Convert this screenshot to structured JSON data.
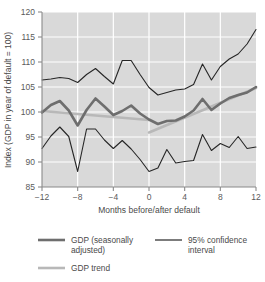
{
  "chart_data": {
    "type": "line",
    "title": "",
    "xlabel": "Months before/after default",
    "ylabel": "Index (GDP in year of default = 100)",
    "xlim": [
      -12,
      12
    ],
    "ylim": [
      85,
      120
    ],
    "xticks": [
      -12,
      -8,
      -4,
      0,
      4,
      8,
      12
    ],
    "yticks": [
      85,
      90,
      95,
      100,
      105,
      110,
      115,
      120
    ],
    "xtick_labels": [
      "−12",
      "−8",
      "−4",
      "0",
      "4",
      "8",
      "12"
    ],
    "ytick_labels": [
      "85",
      "90",
      "95",
      "100",
      "105",
      "110",
      "115",
      "120"
    ],
    "grid": true,
    "grid_color": "#ffffff",
    "plot_background": "#d9d9d9",
    "legend_position": "below",
    "x": [
      -12,
      -11,
      -10,
      -9,
      -8,
      -7,
      -6,
      -5,
      -4,
      -3,
      -2,
      -1,
      0,
      1,
      2,
      3,
      4,
      5,
      6,
      7,
      8,
      9,
      10,
      11,
      12
    ],
    "series": [
      {
        "name": "GDP (seasonally adjusted)",
        "color": "#6e6e6e",
        "width": 2.6,
        "values": [
          99.9,
          101.4,
          102.2,
          100.3,
          97.3,
          100.4,
          102.7,
          101.1,
          99.4,
          100.2,
          101.3,
          99.7,
          98.5,
          97.6,
          98.2,
          98.3,
          99.1,
          100.3,
          102.6,
          100.4,
          101.7,
          102.8,
          103.4,
          103.9,
          105.0
        ]
      },
      {
        "name": "95% confidence interval",
        "color": "#262626",
        "width": 1.1,
        "is_band": true,
        "upper": [
          106.4,
          106.6,
          106.9,
          106.7,
          105.9,
          107.5,
          108.7,
          107.1,
          105.6,
          110.3,
          110.3,
          107.5,
          104.9,
          103.4,
          103.9,
          104.4,
          104.6,
          105.5,
          109.6,
          106.4,
          109.1,
          110.6,
          111.6,
          113.6,
          116.5
        ],
        "lower": [
          92.7,
          95.2,
          97.0,
          95.1,
          88.1,
          96.6,
          96.6,
          94.4,
          92.7,
          94.3,
          92.6,
          90.5,
          88.1,
          88.8,
          92.5,
          89.8,
          90.1,
          90.3,
          95.5,
          92.3,
          93.7,
          92.9,
          95.1,
          92.7,
          93.0
        ]
      },
      {
        "name": "GDP trend",
        "color": "#b8b8b8",
        "width": 2.6,
        "segments": [
          {
            "x": [
              -12,
              0
            ],
            "values": [
              100.2,
              98.4
            ]
          },
          {
            "x": [
              0,
              12
            ],
            "values": [
              95.9,
              104.8
            ]
          }
        ]
      }
    ]
  },
  "legend": {
    "entries": [
      {
        "label_line1": "GDP (seasonally",
        "label_line2": "adjusted)",
        "color": "#6e6e6e",
        "width": 2.6
      },
      {
        "label_line1": "95% confidence",
        "label_line2": "interval",
        "color": "#262626",
        "width": 1.2
      },
      {
        "label_line1": "GDP trend",
        "label_line2": "",
        "color": "#b8b8b8",
        "width": 2.6
      }
    ]
  }
}
